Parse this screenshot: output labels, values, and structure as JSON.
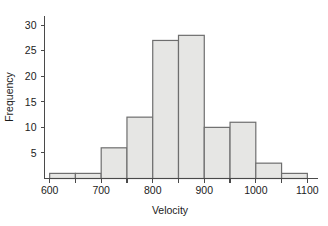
{
  "chart_data": {
    "type": "bar",
    "title": "",
    "subtitle": "",
    "xlabel": "Velocity",
    "ylabel": "Frequency",
    "bin_width": 50,
    "bin_edges": [
      600,
      650,
      700,
      750,
      800,
      850,
      900,
      950,
      1000,
      1050,
      1100
    ],
    "categories": [
      "600-650",
      "650-700",
      "700-750",
      "750-800",
      "800-850",
      "850-900",
      "900-950",
      "950-1000",
      "1000-1050",
      "1050-1100"
    ],
    "values": [
      1,
      1,
      6,
      12,
      27,
      28,
      10,
      11,
      3,
      1
    ],
    "x": [
      625,
      675,
      725,
      775,
      825,
      875,
      925,
      975,
      1025,
      1075
    ],
    "xlim": [
      590,
      1110
    ],
    "ylim": [
      0,
      31
    ],
    "x_major_ticks": [
      600,
      700,
      800,
      900,
      1000,
      1100
    ],
    "x_minor_ticks": [
      650,
      750,
      850,
      950,
      1050
    ],
    "x_tick_labels": [
      "600",
      "700",
      "800",
      "900",
      "1000",
      "1100"
    ],
    "y_ticks": [
      5,
      10,
      15,
      20,
      25,
      30
    ],
    "y_tick_labels": [
      "5",
      "10",
      "15",
      "20",
      "25",
      "30"
    ],
    "grid": false,
    "legend": null,
    "legend_position": "none",
    "annotations": [],
    "colors": {
      "bar_fill": "#e6e6e4",
      "bar_stroke": "#6e6e6e",
      "axis": "#4a4a4a",
      "text": "#1c1c1c",
      "background": "#ffffff"
    }
  }
}
